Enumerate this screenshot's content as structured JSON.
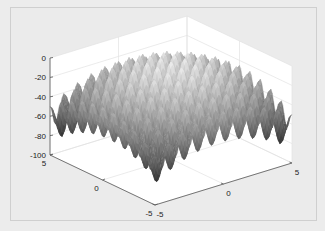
{
  "chart_data": {
    "type": "surface",
    "title": "",
    "function": "z = -(20 + x^2 - 10*cos(2*pi*x) + y^2 - 10*cos(2*pi*y))",
    "colormap": "gray",
    "xlabel": "",
    "ylabel": "",
    "zlabel": "",
    "xlim": [
      -5,
      5
    ],
    "ylim": [
      -5,
      5
    ],
    "zlim": [
      -100,
      0
    ],
    "x_ticks": [
      "-5",
      "0",
      "5"
    ],
    "y_ticks": [
      "-5",
      "0",
      "5"
    ],
    "z_ticks": [
      "0",
      "-20",
      "-40",
      "-60",
      "-80",
      "-100"
    ],
    "x_tick_values": [
      -5,
      0,
      5
    ],
    "y_tick_values": [
      -5,
      0,
      5
    ],
    "z_tick_values": [
      0,
      -20,
      -40,
      -60,
      -80,
      -100
    ],
    "grid": true,
    "box": false,
    "colors": {
      "figure_bg": "#ebebeb",
      "axes_bg": "#ffffff",
      "grid": "#e3e3e3",
      "axis_line": "#555555",
      "surface_low": "#0a0a0a",
      "surface_high": "#f2f2f2"
    }
  }
}
